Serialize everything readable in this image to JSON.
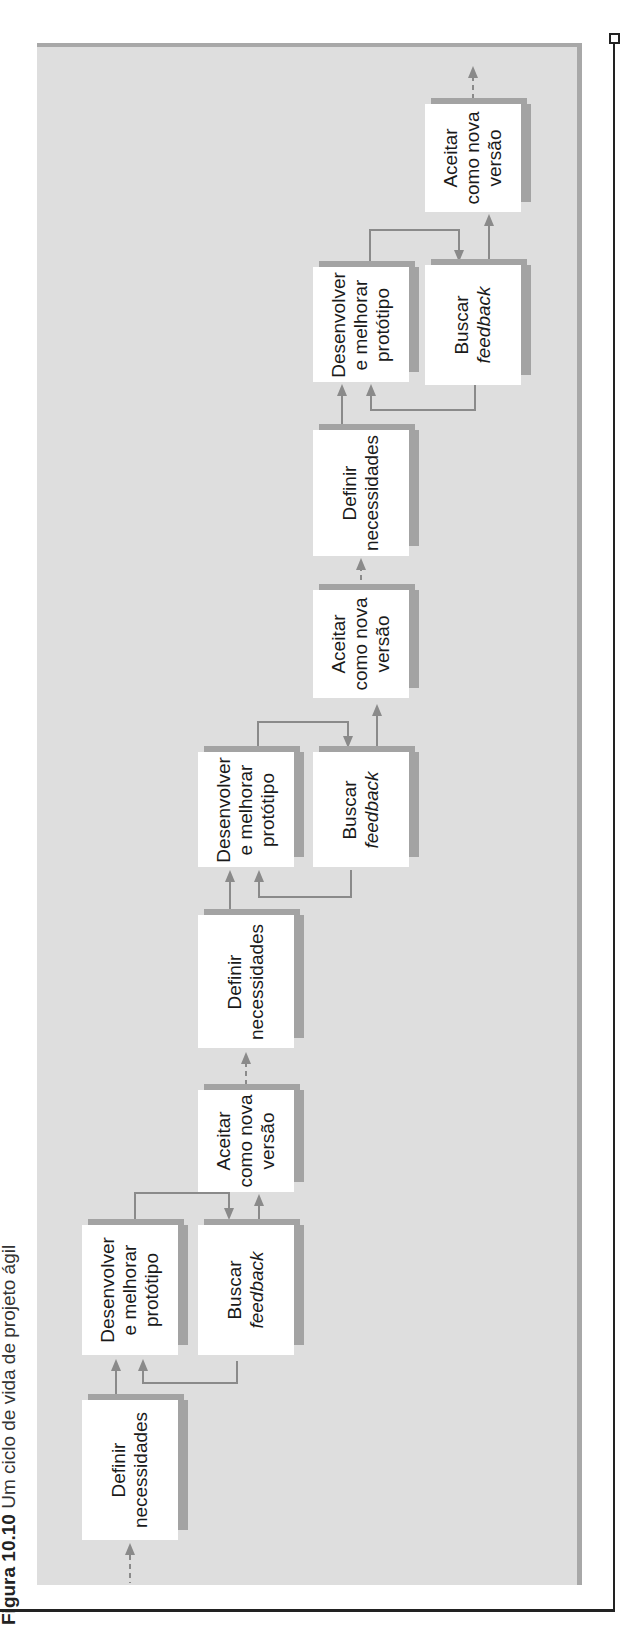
{
  "caption": {
    "figure_label": "Figura 10.10",
    "title": "Um ciclo de vida de projeto ágil"
  },
  "diagram": {
    "cycles": [
      {
        "define": {
          "line1": "Definir",
          "line2": "necessidades"
        },
        "develop": {
          "line1": "Desenvolver",
          "line2": "e melhorar",
          "line3": "protótipo"
        },
        "feedback": {
          "line1": "Buscar",
          "line2": "feedback"
        },
        "accept": {
          "line1": "Aceitar",
          "line2": "como nova",
          "line3": "versão"
        }
      },
      {
        "define": {
          "line1": "Definir",
          "line2": "necessidades"
        },
        "develop": {
          "line1": "Desenvolver",
          "line2": "e melhorar",
          "line3": "protótipo"
        },
        "feedback": {
          "line1": "Buscar",
          "line2": "feedback"
        },
        "accept": {
          "line1": "Aceitar",
          "line2": "como nova",
          "line3": "versão"
        }
      },
      {
        "define": {
          "line1": "Definir",
          "line2": "necessidades"
        },
        "develop": {
          "line1": "Desenvolver",
          "line2": "e melhorar",
          "line3": "protótipo"
        },
        "feedback": {
          "line1": "Buscar",
          "line2": "feedback"
        },
        "accept": {
          "line1": "Aceitar",
          "line2": "como nova",
          "line3": "versão"
        }
      }
    ],
    "colors": {
      "panel": "#dedede",
      "panel_border": "#a8a8a8",
      "box": "#ffffff",
      "box_shadow": "#a3a3a3",
      "arrow": "#8a8a8a",
      "frame": "#222222"
    }
  }
}
